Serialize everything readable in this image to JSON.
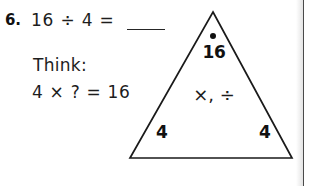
{
  "problem": {
    "number": "6.",
    "equation": "16 ÷ 4 =",
    "answer_blank": "",
    "think_label": "Think:",
    "think_equation": "4 × ? = 16"
  },
  "fact_triangle": {
    "top_number": "16",
    "operators": "×, ÷",
    "left_number": "4",
    "right_number": "4",
    "dot_marker": "dot",
    "outline_color": "#1a1a1a"
  },
  "colors": {
    "ink": "#1a1a1a",
    "paper": "#ffffff",
    "page_edge": "#4a4a4a"
  }
}
